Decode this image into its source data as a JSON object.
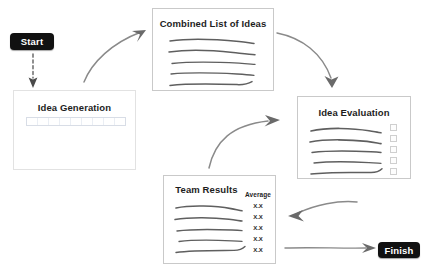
{
  "diagram": {
    "background_color": "#ffffff",
    "terminator_color": "#111111",
    "terminator_text_color": "#ffffff",
    "box_border_color": "#c9c9c9",
    "ink_color": "#6e6e6e"
  },
  "terminators": {
    "start": {
      "label": "Start"
    },
    "finish": {
      "label": "Finish"
    }
  },
  "boxes": {
    "idea_generation": {
      "title": "Idea Generation",
      "line_count": 0,
      "has_table_strip": true,
      "table_strip_cells": 9
    },
    "combined_list": {
      "title": "Combined List of Ideas",
      "line_count": 5
    },
    "idea_evaluation": {
      "title": "Idea Evaluation",
      "line_count": 5,
      "checkbox_count": 5
    },
    "team_results": {
      "title": "Team Results",
      "line_count": 5,
      "average_header": "Average",
      "average_values": [
        "X.X",
        "X.X",
        "X.X",
        "X.X",
        "X.X"
      ]
    }
  },
  "connectors": [
    {
      "name": "start-to-idea-generation",
      "style": "dashed-straight-down"
    },
    {
      "name": "idea-generation-to-combined-list",
      "style": "hand-drawn-curve-up-right"
    },
    {
      "name": "combined-list-to-idea-evaluation",
      "style": "hand-drawn-curve-down-right"
    },
    {
      "name": "idea-evaluation-to-team-results",
      "style": "hand-drawn-curve-left"
    },
    {
      "name": "team-results-to-idea-evaluation",
      "style": "hand-drawn-curve-up-right"
    },
    {
      "name": "team-results-to-finish",
      "style": "hand-drawn-straight-right"
    }
  ]
}
